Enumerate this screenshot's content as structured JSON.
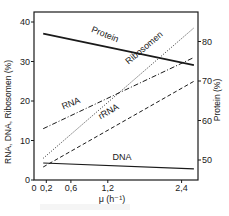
{
  "chart_data": {
    "type": "line",
    "title": "",
    "xlabel": "μ (h⁻¹)",
    "ylabel": "RNA, DNA, Ribosomen (%)",
    "ylabel_right": "Protein (%)",
    "xlim": [
      0,
      2.65
    ],
    "ylim": [
      0,
      42
    ],
    "ylim_right": [
      37.5,
      87.5
    ],
    "x_ticks": [
      0,
      0.2,
      0.6,
      1.2,
      2.4
    ],
    "x_tick_labels": [
      "0",
      "0,2",
      "0,6",
      "1,2",
      "2,4"
    ],
    "y_ticks": [
      0,
      10,
      20,
      30,
      40
    ],
    "y_tick_labels": [
      "0",
      "10",
      "20",
      "30",
      "40"
    ],
    "y_right_ticks": [
      50,
      60,
      70,
      80
    ],
    "y_right_tick_labels": [
      "50",
      "60",
      "70",
      "80"
    ],
    "grid": false,
    "legend": "inline labels",
    "series": [
      {
        "name": "Protein",
        "axis": "right",
        "style": "solid-thick",
        "x": [
          0.15,
          2.6
        ],
        "values": [
          82,
          74
        ]
      },
      {
        "name": "Ribosomen",
        "axis": "left",
        "style": "dotted",
        "x": [
          0.15,
          2.6
        ],
        "values": [
          5.5,
          38.5
        ]
      },
      {
        "name": "RNA",
        "axis": "left",
        "style": "dash-dot",
        "x": [
          0.15,
          2.6
        ],
        "values": [
          13,
          31
        ]
      },
      {
        "name": "rRNA",
        "axis": "left",
        "style": "dashed",
        "x": [
          0.15,
          2.6
        ],
        "values": [
          3.3,
          25
        ]
      },
      {
        "name": "DNA",
        "axis": "left",
        "style": "solid",
        "x": [
          0.15,
          2.6
        ],
        "values": [
          4.3,
          2.8
        ]
      }
    ]
  },
  "colors": {
    "ink": "#1a1a1a",
    "background": "#ffffff"
  }
}
